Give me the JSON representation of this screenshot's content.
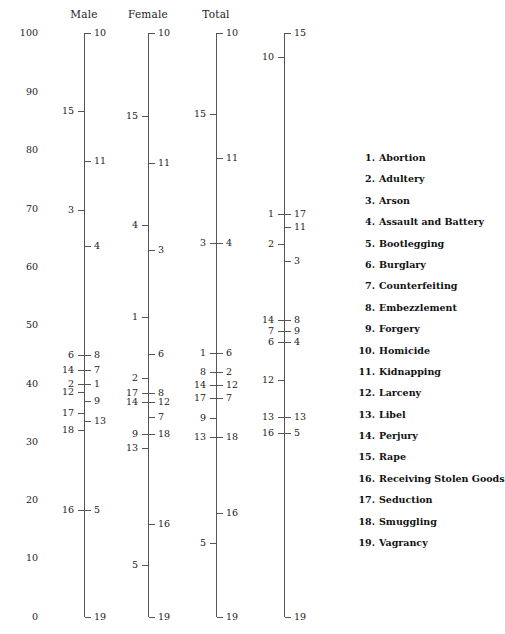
{
  "figure": {
    "columns": [
      {
        "title": "Male",
        "x": 84
      },
      {
        "title": "Female",
        "x": 148
      },
      {
        "title": "Total",
        "x": 216
      },
      {
        "title": "",
        "x": 284
      }
    ],
    "master_scale": {
      "x": 38,
      "labels": [
        "100",
        "90",
        "80",
        "70",
        "60",
        "50",
        "40",
        "30",
        "20",
        "10",
        "0"
      ],
      "y": [
        33,
        92,
        150,
        209,
        267,
        325,
        384,
        442,
        500,
        558,
        617
      ]
    },
    "axes": [
      {
        "name": "male",
        "x": 84,
        "top_y": 33,
        "bottom_y": 617,
        "ticks_right": [
          {
            "label": "10",
            "y": 33
          },
          {
            "label": "11",
            "y": 161
          },
          {
            "label": "4",
            "y": 246
          },
          {
            "label": "8",
            "y": 355
          },
          {
            "label": "7",
            "y": 370
          },
          {
            "label": "1",
            "y": 384
          },
          {
            "label": "9",
            "y": 401
          },
          {
            "label": "13",
            "y": 421
          },
          {
            "label": "5",
            "y": 510
          },
          {
            "label": "19",
            "y": 617
          }
        ],
        "ticks_left": [
          {
            "label": "15",
            "y": 111
          },
          {
            "label": "3",
            "y": 210
          },
          {
            "label": "6",
            "y": 355
          },
          {
            "label": "14",
            "y": 370
          },
          {
            "label": "2",
            "y": 384
          },
          {
            "label": "12",
            "y": 392
          },
          {
            "label": "17",
            "y": 413
          },
          {
            "label": "18",
            "y": 430
          },
          {
            "label": "16",
            "y": 510
          }
        ]
      },
      {
        "name": "female",
        "x": 148,
        "top_y": 33,
        "bottom_y": 617,
        "ticks_right": [
          {
            "label": "10",
            "y": 33
          },
          {
            "label": "11",
            "y": 163
          },
          {
            "label": "3",
            "y": 250
          },
          {
            "label": "6",
            "y": 354
          },
          {
            "label": "8",
            "y": 393
          },
          {
            "label": "12",
            "y": 402
          },
          {
            "label": "7",
            "y": 417
          },
          {
            "label": "18",
            "y": 434
          },
          {
            "label": "16",
            "y": 524
          },
          {
            "label": "19",
            "y": 617
          }
        ],
        "ticks_left": [
          {
            "label": "15",
            "y": 116
          },
          {
            "label": "4",
            "y": 225
          },
          {
            "label": "1",
            "y": 317
          },
          {
            "label": "2",
            "y": 378
          },
          {
            "label": "17",
            "y": 393
          },
          {
            "label": "14",
            "y": 402
          },
          {
            "label": "9",
            "y": 434
          },
          {
            "label": "13",
            "y": 448
          },
          {
            "label": "5",
            "y": 565
          }
        ]
      },
      {
        "name": "total",
        "x": 216,
        "top_y": 33,
        "bottom_y": 617,
        "ticks_right": [
          {
            "label": "10",
            "y": 33
          },
          {
            "label": "11",
            "y": 158
          },
          {
            "label": "4",
            "y": 243
          },
          {
            "label": "6",
            "y": 353
          },
          {
            "label": "2",
            "y": 372
          },
          {
            "label": "12",
            "y": 385
          },
          {
            "label": "7",
            "y": 398
          },
          {
            "label": "18",
            "y": 437
          },
          {
            "label": "16",
            "y": 513
          },
          {
            "label": "19",
            "y": 617
          }
        ],
        "ticks_left": [
          {
            "label": "15",
            "y": 114
          },
          {
            "label": "3",
            "y": 243
          },
          {
            "label": "1",
            "y": 353
          },
          {
            "label": "8",
            "y": 372
          },
          {
            "label": "14",
            "y": 385
          },
          {
            "label": "17",
            "y": 398
          },
          {
            "label": "9",
            "y": 418
          },
          {
            "label": "13",
            "y": 437
          },
          {
            "label": "5",
            "y": 543
          }
        ]
      },
      {
        "name": "fourth",
        "x": 284,
        "top_y": 33,
        "bottom_y": 617,
        "ticks_right": [
          {
            "label": "15",
            "y": 33
          },
          {
            "label": "17",
            "y": 214
          },
          {
            "label": "11",
            "y": 227
          },
          {
            "label": "3",
            "y": 261
          },
          {
            "label": "8",
            "y": 320
          },
          {
            "label": "9",
            "y": 331
          },
          {
            "label": "4",
            "y": 342
          },
          {
            "label": "13",
            "y": 417
          },
          {
            "label": "5",
            "y": 433
          },
          {
            "label": "19",
            "y": 617
          }
        ],
        "ticks_left": [
          {
            "label": "10",
            "y": 57
          },
          {
            "label": "1",
            "y": 214
          },
          {
            "label": "2",
            "y": 244
          },
          {
            "label": "14",
            "y": 320
          },
          {
            "label": "7",
            "y": 331
          },
          {
            "label": "6",
            "y": 342
          },
          {
            "label": "12",
            "y": 380
          },
          {
            "label": "13",
            "y": 417
          },
          {
            "label": "16",
            "y": 433
          }
        ]
      }
    ],
    "legend": [
      {
        "num": "1.",
        "label": "Abortion"
      },
      {
        "num": "2.",
        "label": "Adultery"
      },
      {
        "num": "3.",
        "label": "Arson"
      },
      {
        "num": "4.",
        "label": "Assault and Battery"
      },
      {
        "num": "5.",
        "label": "Bootlegging"
      },
      {
        "num": "6.",
        "label": "Burglary"
      },
      {
        "num": "7.",
        "label": "Counterfeiting"
      },
      {
        "num": "8.",
        "label": "Embezzlement"
      },
      {
        "num": "9.",
        "label": "Forgery"
      },
      {
        "num": "10.",
        "label": "Homicide"
      },
      {
        "num": "11.",
        "label": "Kidnapping"
      },
      {
        "num": "12.",
        "label": "Larceny"
      },
      {
        "num": "13.",
        "label": "Libel"
      },
      {
        "num": "14.",
        "label": "Perjury"
      },
      {
        "num": "15.",
        "label": "Rape"
      },
      {
        "num": "16.",
        "label": "Receiving Stolen Goods"
      },
      {
        "num": "17.",
        "label": "Seduction"
      },
      {
        "num": "18.",
        "label": "Smuggling"
      },
      {
        "num": "19.",
        "label": "Vagrancy"
      }
    ],
    "colors": {
      "ink": "#1a1a1a",
      "rule": "#555555",
      "background": "#ffffff"
    }
  },
  "chart_data": {
    "type": "scatter",
    "title": "",
    "subtitle": "",
    "xlabel": "",
    "ylabel": "",
    "ylim": [
      0,
      100
    ],
    "grid": false,
    "legend_position": "right",
    "categories": [
      "Abortion",
      "Adultery",
      "Arson",
      "Assault and Battery",
      "Bootlegging",
      "Burglary",
      "Counterfeiting",
      "Embezzlement",
      "Forgery",
      "Homicide",
      "Kidnapping",
      "Larceny",
      "Libel",
      "Perjury",
      "Rape",
      "Receiving Stolen Goods",
      "Seduction",
      "Smuggling",
      "Vagrancy"
    ],
    "series": [
      {
        "name": "Male",
        "values": [
          39.9,
          39.9,
          69.7,
          63.5,
          18.3,
          44.9,
          42.3,
          44.9,
          37.0,
          100.0,
          78.1,
          38.5,
          33.6,
          42.3,
          86.6,
          18.3,
          34.9,
          32.0,
          0.0
        ]
      },
      {
        "name": "Female",
        "values": [
          51.4,
          40.9,
          62.8,
          66.8,
          8.9,
          45.0,
          34.2,
          38.0,
          31.3,
          100.0,
          77.7,
          36.8,
          28.9,
          36.8,
          85.8,
          15.9,
          38.4,
          31.3,
          0.0
        ]
      },
      {
        "name": "Total",
        "values": [
          45.2,
          41.9,
          64.0,
          64.0,
          12.7,
          45.2,
          37.5,
          41.9,
          34.1,
          100.0,
          78.6,
          39.7,
          30.8,
          39.7,
          86.1,
          17.8,
          37.5,
          30.8,
          0.0
        ]
      },
      {
        "name": "Fourth",
        "values": [
          69.0,
          63.9,
          61.0,
          47.1,
          31.5,
          47.1,
          49.0,
          50.9,
          49.0,
          96.1,
          66.8,
          40.6,
          34.2,
          50.9,
          100.0,
          31.5,
          69.0,
          0.0,
          0.0
        ]
      }
    ],
    "axis_tick_labels": [
      "100",
      "90",
      "80",
      "70",
      "60",
      "50",
      "40",
      "30",
      "20",
      "10",
      "0"
    ]
  }
}
